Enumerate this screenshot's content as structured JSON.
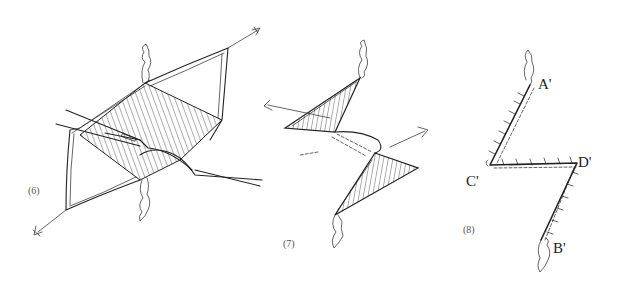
{
  "figure": {
    "panels": [
      {
        "id": "panel-6",
        "label": "(6)"
      },
      {
        "id": "panel-7",
        "label": "(7)"
      },
      {
        "id": "panel-8",
        "label": "(8)"
      }
    ],
    "points": {
      "a_prime": "A'",
      "b_prime": "B'",
      "c_prime": "C'",
      "d_prime": "D'"
    }
  }
}
